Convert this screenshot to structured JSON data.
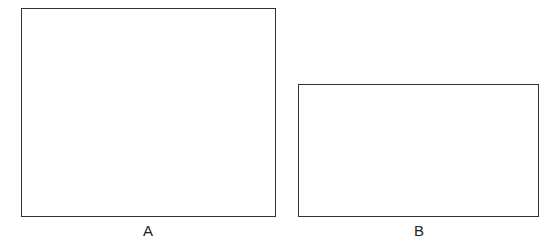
{
  "figure": {
    "shapes": [
      {
        "id": "A",
        "label": "A",
        "type": "rectangle"
      },
      {
        "id": "B",
        "label": "B",
        "type": "rectangle"
      }
    ]
  }
}
